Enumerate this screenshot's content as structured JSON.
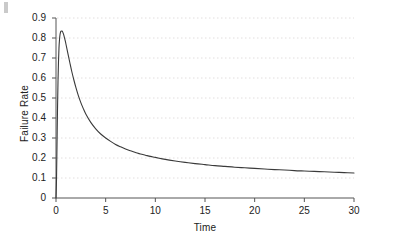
{
  "figure": {
    "background_color": "#ffffff",
    "axis_color": "#555555",
    "grid_color": "#e2dede",
    "curve_color": "#3a3a3a",
    "text_color": "#222222",
    "corner_artifact": true
  },
  "chart_data": {
    "type": "line",
    "title": "",
    "xlabel": "Time",
    "ylabel": "Failure Rate",
    "xlim": [
      0,
      30
    ],
    "ylim": [
      0,
      0.9
    ],
    "grid": true,
    "grid_axis": "y",
    "legend": false,
    "legend_position": "none",
    "xticks": [
      0,
      5,
      10,
      15,
      20,
      25,
      30
    ],
    "xtick_labels": [
      "0",
      "5",
      "10",
      "15",
      "20",
      "25",
      "30"
    ],
    "yticks": [
      0,
      0.1,
      0.2,
      0.3,
      0.4,
      0.5,
      0.6,
      0.7,
      0.8,
      0.9
    ],
    "ytick_labels": [
      "0",
      "0.1",
      "0.2",
      "0.3",
      "0.4",
      "0.5",
      "0.6",
      "0.7",
      "0.8",
      "0.9"
    ],
    "series": [
      {
        "name": "Failure Rate",
        "color": "#3a3a3a",
        "line_width": 1.1,
        "peak_x": 0.6,
        "peak_y": 0.835,
        "x": [
          0,
          0.05,
          0.1,
          0.15,
          0.2,
          0.25,
          0.3,
          0.35,
          0.4,
          0.45,
          0.5,
          0.55,
          0.6,
          0.65,
          0.7,
          0.8,
          0.9,
          1.0,
          1.2,
          1.4,
          1.6,
          1.8,
          2.0,
          2.25,
          2.5,
          2.75,
          3.0,
          3.5,
          4.0,
          4.5,
          5.0,
          5.5,
          6.0,
          6.5,
          7.0,
          7.5,
          8.0,
          8.5,
          9.0,
          9.5,
          10.0,
          11.0,
          12.0,
          13.0,
          14.0,
          15.0,
          16.0,
          17.0,
          18.0,
          19.0,
          20.0,
          21.0,
          22.0,
          23.0,
          24.0,
          25.0,
          26.0,
          27.0,
          28.0,
          29.0,
          30.0
        ],
        "y": [
          0.0,
          0.09,
          0.26,
          0.44,
          0.58,
          0.68,
          0.75,
          0.79,
          0.815,
          0.828,
          0.834,
          0.835,
          0.835,
          0.832,
          0.827,
          0.812,
          0.792,
          0.77,
          0.722,
          0.675,
          0.63,
          0.59,
          0.553,
          0.512,
          0.477,
          0.447,
          0.42,
          0.378,
          0.346,
          0.32,
          0.3,
          0.283,
          0.268,
          0.256,
          0.245,
          0.236,
          0.228,
          0.22,
          0.214,
          0.208,
          0.203,
          0.193,
          0.185,
          0.178,
          0.172,
          0.167,
          0.162,
          0.158,
          0.154,
          0.151,
          0.148,
          0.145,
          0.142,
          0.14,
          0.137,
          0.135,
          0.133,
          0.131,
          0.129,
          0.127,
          0.125
        ]
      }
    ]
  }
}
